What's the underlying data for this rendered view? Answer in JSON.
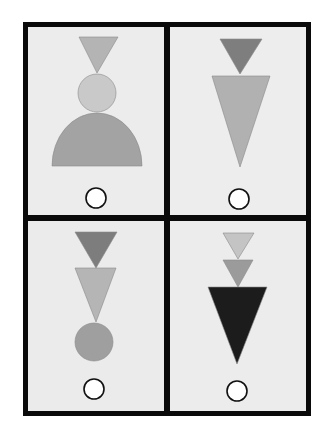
{
  "figure": {
    "colors": {
      "frame": "#0a0a0a",
      "card_bg": "#ececec",
      "answer_circle_fill": "#ffffff",
      "answer_circle_stroke": "#111111"
    },
    "panels": [
      {
        "id": "top-left",
        "shapes": [
          {
            "type": "triangle-down",
            "fill": "#b4b4b4",
            "points": "79,37 118,37 97,73"
          },
          {
            "type": "circle",
            "fill": "#c9c9c9",
            "cx": 97,
            "cy": 93,
            "r": 19
          },
          {
            "type": "semicircle",
            "fill": "#a3a3a3",
            "d": "M52,166 A45,53 0 0 1 142,166 Z"
          }
        ],
        "answer": {
          "cx": 96,
          "cy": 198,
          "r": 10
        }
      },
      {
        "id": "top-right",
        "shapes": [
          {
            "type": "triangle-down",
            "fill": "#7e7e7e",
            "points": "220,39 262,39 240,74"
          },
          {
            "type": "triangle-down",
            "fill": "#b1b1b1",
            "points": "212,76 270,76 240,167"
          }
        ],
        "answer": {
          "cx": 239,
          "cy": 199,
          "r": 10
        }
      },
      {
        "id": "bottom-left",
        "shapes": [
          {
            "type": "triangle-down",
            "fill": "#7d7d7d",
            "points": "75,232 117,232 96,268"
          },
          {
            "type": "triangle-down",
            "fill": "#b5b5b5",
            "points": "75,268 116,268 96,322"
          },
          {
            "type": "circle",
            "fill": "#9f9f9f",
            "cx": 94,
            "cy": 342,
            "r": 19
          }
        ],
        "answer": {
          "cx": 94,
          "cy": 389,
          "r": 10
        }
      },
      {
        "id": "bottom-right",
        "shapes": [
          {
            "type": "triangle-down",
            "fill": "#c4c4c4",
            "points": "223,233 254,233 238,259"
          },
          {
            "type": "triangle-down",
            "fill": "#9b9b9b",
            "points": "223,260 253,260 238,287"
          },
          {
            "type": "triangle-down",
            "fill": "#1c1c1c",
            "points": "208,287 267,287 237,364"
          }
        ],
        "answer": {
          "cx": 237,
          "cy": 391,
          "r": 10
        }
      }
    ]
  }
}
